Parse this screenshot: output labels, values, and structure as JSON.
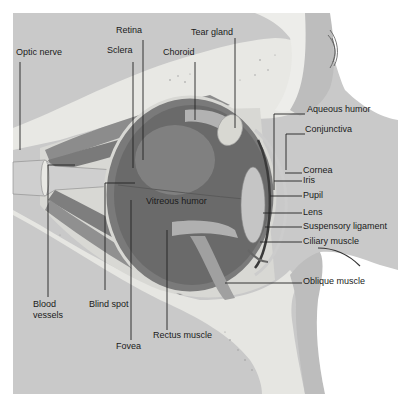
{
  "figure": {
    "colors": {
      "background": "#ffffff",
      "orbit_bone": "#c9c9c9",
      "orbit_bone_dark": "#b5b5b5",
      "fat_tissue": "#e6e6e2",
      "eyeball": "#6e6e6e",
      "eyeball_light": "#9a9a9a",
      "muscle": "#8a8a8a",
      "lens": "#c8c8c8",
      "leader_line": "#222222",
      "label_text": "#1a1a1a"
    }
  },
  "labels": {
    "optic_nerve": "Optic nerve",
    "retina": "Retina",
    "sclera": "Sclera",
    "choroid": "Choroid",
    "tear_gland": "Tear gland",
    "aqueous_humor": "Aqueous humor",
    "conjunctiva": "Conjunctiva",
    "cornea": "Cornea",
    "iris": "Iris",
    "pupil": "Pupil",
    "lens": "Lens",
    "suspensory_ligament": "Suspensory ligament",
    "ciliary_muscle": "Ciliary muscle",
    "vitreous_humor": "Vitreous humor",
    "oblique_muscle": "Oblique muscle",
    "blood_vessels_line1": "Blood",
    "blood_vessels_line2": "vessels",
    "blind_spot": "Blind spot",
    "fovea": "Fovea",
    "rectus_muscle": "Rectus muscle"
  }
}
